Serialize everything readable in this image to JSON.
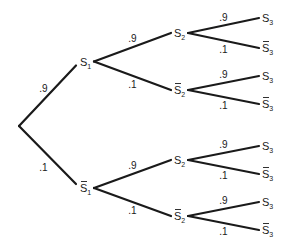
{
  "diagram": {
    "type": "probability-tree",
    "root": {
      "children": [
        {
          "prob": ".9",
          "label": {
            "base": "S",
            "sub": "1",
            "bar": false
          },
          "children": [
            {
              "prob": ".9",
              "label": {
                "base": "S",
                "sub": "2",
                "bar": false
              },
              "children": [
                {
                  "prob": ".9",
                  "label": {
                    "base": "S",
                    "sub": "3",
                    "bar": false
                  }
                },
                {
                  "prob": ".1",
                  "label": {
                    "base": "S",
                    "sub": "3",
                    "bar": true
                  }
                }
              ]
            },
            {
              "prob": ".1",
              "label": {
                "base": "S",
                "sub": "2",
                "bar": true
              },
              "children": [
                {
                  "prob": ".9",
                  "label": {
                    "base": "S",
                    "sub": "3",
                    "bar": false
                  }
                },
                {
                  "prob": ".1",
                  "label": {
                    "base": "S",
                    "sub": "3",
                    "bar": true
                  }
                }
              ]
            }
          ]
        },
        {
          "prob": ".1",
          "label": {
            "base": "S",
            "sub": "1",
            "bar": true
          },
          "children": [
            {
              "prob": ".9",
              "label": {
                "base": "S",
                "sub": "2",
                "bar": false
              },
              "children": [
                {
                  "prob": ".9",
                  "label": {
                    "base": "S",
                    "sub": "3",
                    "bar": false
                  }
                },
                {
                  "prob": ".1",
                  "label": {
                    "base": "S",
                    "sub": "3",
                    "bar": true
                  }
                }
              ]
            },
            {
              "prob": ".1",
              "label": {
                "base": "S",
                "sub": "2",
                "bar": true
              },
              "children": [
                {
                  "prob": ".9",
                  "label": {
                    "base": "S",
                    "sub": "3",
                    "bar": false
                  }
                },
                {
                  "prob": ".1",
                  "label": {
                    "base": "S",
                    "sub": "3",
                    "bar": true
                  }
                }
              ]
            }
          ]
        }
      ]
    }
  }
}
